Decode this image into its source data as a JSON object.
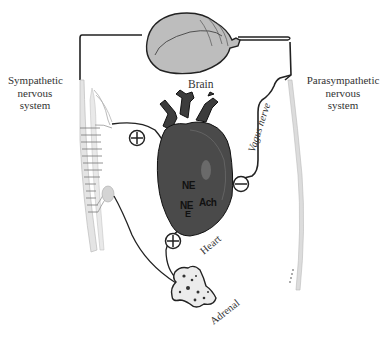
{
  "diagram": {
    "labels": {
      "brain": "Brain",
      "sympathetic_line1": "Sympathetic",
      "sympathetic_line2": "nervous",
      "sympathetic_line3": "system",
      "parasympathetic_line1": "Parasympathetic",
      "parasympathetic_line2": "nervous",
      "parasympathetic_line3": "system",
      "vagus_nerve": "Vagus nerve",
      "heart": "Heart",
      "adrenal": "Adrenal",
      "ne_1": "NE",
      "ne_2": "NE",
      "ne_2_sub": "E",
      "ach": "Ach"
    },
    "signs": {
      "sympathetic_to_heart": "+",
      "vagus_to_heart": "−",
      "adrenal_to_heart": "+"
    },
    "colors": {
      "line": "#222222",
      "brain_fill": "#bdbdbd",
      "heart_fill": "#4a4a4a",
      "vessel_fill": "#3c3c3c",
      "spine_fill": "#e0e0e0",
      "adrenal_fill": "#e8e8e8"
    }
  }
}
